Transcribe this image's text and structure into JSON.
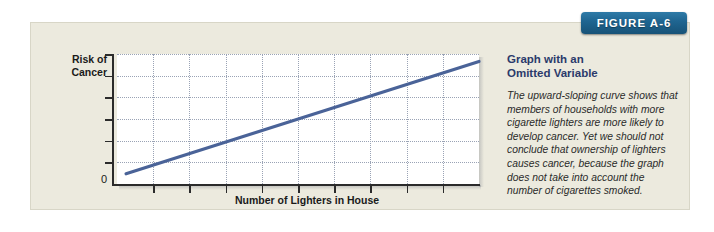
{
  "figure": {
    "badge_label": "FIGURE A-6",
    "card_bg": "#eceade",
    "badge_color": "#1f6591",
    "heading_color": "#2b3a6b",
    "line_color": "#4a6398"
  },
  "caption": {
    "heading": "Graph with an\nOmitted Variable",
    "body": "The upward-sloping curve shows that members of households with more cigarette lighters are more likely to develop cancer. Yet we should not conclude that ownership of lighters causes cancer, because the graph does not take into account the number of cigarettes smoked."
  },
  "chart_data": {
    "type": "line",
    "title": "",
    "xlabel": "Number of Lighters in House",
    "ylabel": "Risk of Cancer",
    "ylabel_lines": [
      "Risk of",
      "Cancer"
    ],
    "origin_label": "0",
    "xlim": [
      0,
      10
    ],
    "ylim": [
      0,
      7
    ],
    "grid": true,
    "legend": "none",
    "x_tick_count": 9,
    "y_tick_count": 6,
    "series": [
      {
        "name": "Risk of cancer vs. lighters",
        "x": [
          0.25,
          10.0
        ],
        "y": [
          0.55,
          6.6
        ]
      }
    ]
  }
}
